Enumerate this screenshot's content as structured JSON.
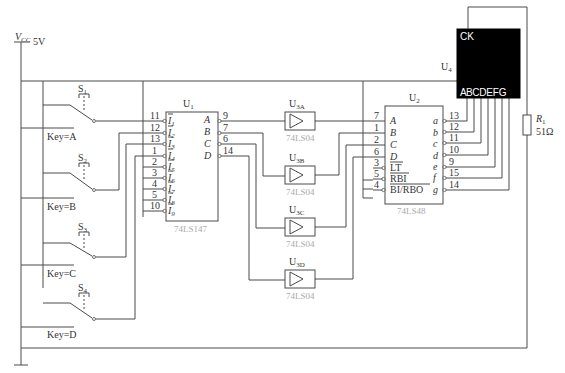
{
  "power": {
    "label": "V",
    "sub": "CC",
    "value": "5V"
  },
  "switches": [
    {
      "name": "S",
      "sub": "1",
      "key": "Key=A"
    },
    {
      "name": "S",
      "sub": "2",
      "key": "Key=B"
    },
    {
      "name": "S",
      "sub": "3",
      "key": "Key=C"
    },
    {
      "name": "S",
      "sub": "4",
      "key": "Key=D"
    }
  ],
  "u1": {
    "ref": "U",
    "ref_sub": "1",
    "part": "74LS147",
    "inputs": [
      {
        "pin": "11",
        "name": "I",
        "sub": "1"
      },
      {
        "pin": "12",
        "name": "I",
        "sub": "2"
      },
      {
        "pin": "13",
        "name": "I",
        "sub": "3"
      },
      {
        "pin": "1",
        "name": "I",
        "sub": "4"
      },
      {
        "pin": "2",
        "name": "I",
        "sub": "5"
      },
      {
        "pin": "3",
        "name": "I",
        "sub": "6"
      },
      {
        "pin": "4",
        "name": "I",
        "sub": "7"
      },
      {
        "pin": "5",
        "name": "I",
        "sub": "8"
      },
      {
        "pin": "10",
        "name": "I",
        "sub": "9"
      }
    ],
    "outputs": [
      {
        "pin": "9",
        "name": "A"
      },
      {
        "pin": "7",
        "name": "B"
      },
      {
        "pin": "6",
        "name": "C"
      },
      {
        "pin": "14",
        "name": "D"
      }
    ]
  },
  "u3": [
    {
      "ref": "U",
      "ref_sub": "3A",
      "part": "74LS04"
    },
    {
      "ref": "U",
      "ref_sub": "3B",
      "part": "74LS04"
    },
    {
      "ref": "U",
      "ref_sub": "3C",
      "part": "74LS04"
    },
    {
      "ref": "U",
      "ref_sub": "3D",
      "part": "74LS04"
    }
  ],
  "u2": {
    "ref": "U",
    "ref_sub": "2",
    "part": "74LS48",
    "inputs": [
      {
        "pin": "7",
        "name": "A"
      },
      {
        "pin": "1",
        "name": "B"
      },
      {
        "pin": "2",
        "name": "C"
      },
      {
        "pin": "6",
        "name": "D"
      },
      {
        "pin": "3",
        "name": "LT"
      },
      {
        "pin": "5",
        "name": "RBI"
      },
      {
        "pin": "4",
        "name": "BI/RBO"
      }
    ],
    "outputs": [
      {
        "pin": "13",
        "name": "a"
      },
      {
        "pin": "12",
        "name": "b"
      },
      {
        "pin": "11",
        "name": "c"
      },
      {
        "pin": "10",
        "name": "d"
      },
      {
        "pin": "9",
        "name": "e"
      },
      {
        "pin": "15",
        "name": "f"
      },
      {
        "pin": "14",
        "name": "g"
      }
    ]
  },
  "u4": {
    "ref": "U",
    "ref_sub": "4",
    "ck": "CK",
    "segments": "A B C D E F G"
  },
  "r1": {
    "name": "R",
    "sub": "1",
    "value": "51Ω"
  }
}
